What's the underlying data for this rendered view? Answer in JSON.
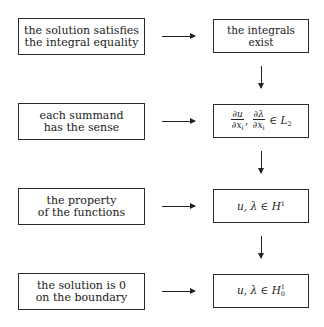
{
  "diagram": {
    "rows": [
      {
        "left_text": "the solution satisfies\nthe integral equality",
        "right_text": "the integrals exist"
      },
      {
        "left_text": "each summand\nhas the sense",
        "right_math": {
          "frac1_num": "∂u",
          "frac1_den": "∂x",
          "frac1_den_sub": "i",
          "comma": ",",
          "frac2_num": "∂λ",
          "frac2_den": "∂x",
          "frac2_den_sub": "i",
          "rel": "∈",
          "space": "L",
          "space_sub": "2"
        }
      },
      {
        "left_text": "the property\nof the functions",
        "right_math": {
          "vars": "u, λ",
          "rel": "∈",
          "space": "H",
          "space_sup": "1"
        }
      },
      {
        "left_text": "the solution is 0\non the boundary",
        "right_math": {
          "vars": "u, λ",
          "rel": "∈",
          "space": "H",
          "space_sup": "1",
          "space_sub": "0"
        }
      }
    ],
    "horizontal_arrow_icon": "arrow-right-icon",
    "vertical_arrow_icon": "arrow-down-icon"
  }
}
